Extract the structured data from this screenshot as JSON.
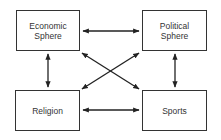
{
  "diagram": {
    "nodes": [
      {
        "id": "economic",
        "label": "Economic\nSphere"
      },
      {
        "id": "political",
        "label": "Political\nSphere"
      },
      {
        "id": "religion",
        "label": "Religion"
      },
      {
        "id": "sports",
        "label": "Sports"
      }
    ],
    "edges": [
      {
        "from": "economic",
        "to": "political",
        "type": "bidirectional"
      },
      {
        "from": "religion",
        "to": "sports",
        "type": "bidirectional"
      },
      {
        "from": "economic",
        "to": "religion",
        "type": "bidirectional"
      },
      {
        "from": "political",
        "to": "sports",
        "type": "bidirectional"
      },
      {
        "from": "economic",
        "to": "sports",
        "type": "bidirectional"
      },
      {
        "from": "political",
        "to": "religion",
        "type": "bidirectional"
      }
    ],
    "colors": {
      "stroke": "#333333",
      "background": "#ffffff"
    }
  }
}
